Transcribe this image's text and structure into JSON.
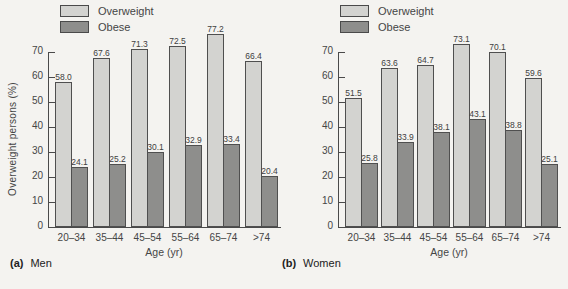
{
  "legend": {
    "overweight": "Overweight",
    "obese": "Obese"
  },
  "colors": {
    "overweight_fill": "#d3d3d0",
    "obese_fill": "#8e8e8c",
    "axis": "#4a4a4a",
    "background": "#f4f3f0"
  },
  "y_axis": {
    "max": 70,
    "ticks": [
      0,
      10,
      20,
      30,
      40,
      50,
      60,
      70
    ]
  },
  "chart_data": [
    {
      "type": "bar",
      "panel": "a",
      "caption_prefix": "(a)",
      "caption": "Men",
      "title": "",
      "xlabel": "Age (yr)",
      "ylabel": "Overweight persons (%)",
      "ylim": [
        0,
        70
      ],
      "grid": false,
      "legend_position": "top-left",
      "categories": [
        "20–34",
        "35–44",
        "45–54",
        "55–64",
        "65–74",
        ">74"
      ],
      "series": [
        {
          "name": "Overweight",
          "values": [
            58.0,
            67.6,
            71.3,
            72.5,
            77.2,
            66.4
          ]
        },
        {
          "name": "Obese",
          "values": [
            24.1,
            25.2,
            30.1,
            32.9,
            33.4,
            20.4
          ]
        }
      ]
    },
    {
      "type": "bar",
      "panel": "b",
      "caption_prefix": "(b)",
      "caption": "Women",
      "title": "",
      "xlabel": "Age (yr)",
      "ylabel": "",
      "ylim": [
        0,
        70
      ],
      "grid": false,
      "legend_position": "top-left",
      "categories": [
        "20–34",
        "35–44",
        "45–54",
        "55–64",
        "65–74",
        ">74"
      ],
      "series": [
        {
          "name": "Overweight",
          "values": [
            51.5,
            63.6,
            64.7,
            73.1,
            70.1,
            59.6
          ]
        },
        {
          "name": "Obese",
          "values": [
            25.8,
            33.9,
            38.1,
            43.1,
            38.8,
            25.1
          ]
        }
      ]
    }
  ]
}
